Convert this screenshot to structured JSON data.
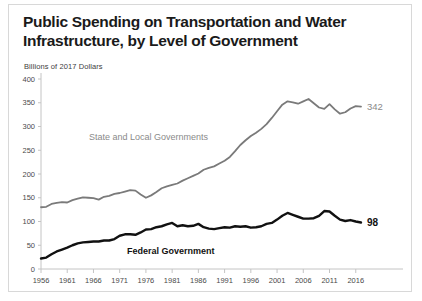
{
  "chart_data": {
    "type": "line",
    "title": "Public Spending on Transportation and Water Infrastructure, by Level of Government",
    "subtitle": "Billions of 2017 Dollars",
    "xlabel": "",
    "ylabel": "",
    "ylim": [
      0,
      400
    ],
    "xlim": [
      1956,
      2017
    ],
    "yticks": [
      0,
      50,
      100,
      150,
      200,
      250,
      300,
      350,
      400
    ],
    "xticks": [
      1956,
      1961,
      1966,
      1971,
      1976,
      1981,
      1986,
      1991,
      1996,
      2001,
      2006,
      2011,
      2016
    ],
    "grid": false,
    "legend_position": "inline-annotation",
    "x": [
      1956,
      1957,
      1958,
      1959,
      1960,
      1961,
      1962,
      1963,
      1964,
      1965,
      1966,
      1967,
      1968,
      1969,
      1970,
      1971,
      1972,
      1973,
      1974,
      1975,
      1976,
      1977,
      1978,
      1979,
      1980,
      1981,
      1982,
      1983,
      1984,
      1985,
      1986,
      1987,
      1988,
      1989,
      1990,
      1991,
      1992,
      1993,
      1994,
      1995,
      1996,
      1997,
      1998,
      1999,
      2000,
      2001,
      2002,
      2003,
      2004,
      2005,
      2006,
      2007,
      2008,
      2009,
      2010,
      2011,
      2012,
      2013,
      2014,
      2015,
      2016,
      2017
    ],
    "series": [
      {
        "name": "State and Local Governments",
        "color": "#7a7a7a",
        "end_value": 342,
        "end_label": "342",
        "values": [
          130,
          131,
          137,
          139,
          141,
          140,
          145,
          148,
          151,
          150,
          149,
          146,
          152,
          154,
          158,
          160,
          163,
          166,
          165,
          157,
          150,
          155,
          162,
          170,
          174,
          177,
          180,
          186,
          191,
          196,
          201,
          209,
          213,
          216,
          222,
          228,
          236,
          248,
          261,
          271,
          280,
          287,
          295,
          305,
          318,
          332,
          346,
          353,
          351,
          348,
          353,
          358,
          349,
          340,
          337,
          347,
          336,
          327,
          330,
          338,
          343,
          342
        ]
      },
      {
        "name": "Federal Government",
        "color": "#111111",
        "end_value": 98,
        "end_label": "98",
        "values": [
          22,
          24,
          31,
          37,
          41,
          45,
          50,
          54,
          56,
          57,
          58,
          58,
          60,
          60,
          63,
          70,
          73,
          73,
          72,
          77,
          83,
          84,
          88,
          90,
          94,
          97,
          90,
          92,
          90,
          91,
          95,
          88,
          85,
          84,
          86,
          88,
          87,
          90,
          89,
          90,
          87,
          88,
          90,
          95,
          97,
          104,
          112,
          118,
          114,
          110,
          106,
          106,
          107,
          112,
          122,
          121,
          112,
          104,
          101,
          103,
          100,
          98
        ]
      }
    ],
    "annotations": [
      {
        "text": "State and Local Governments",
        "series": "State and Local Governments"
      },
      {
        "text": "Federal Government",
        "series": "Federal Government"
      }
    ]
  }
}
